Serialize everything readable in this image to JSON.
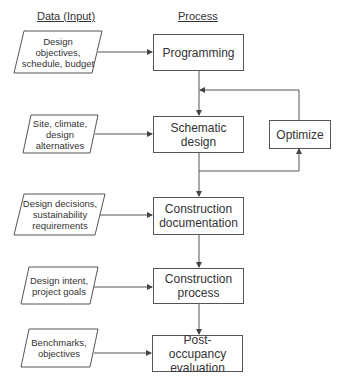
{
  "headers": {
    "input": "Data (Input)",
    "process": "Process"
  },
  "process_steps": [
    {
      "id": "programming",
      "label": "Programming"
    },
    {
      "id": "schematic",
      "label": "Schematic design"
    },
    {
      "id": "construction_doc",
      "label": "Construction documentation"
    },
    {
      "id": "construction_process",
      "label": "Construction process"
    },
    {
      "id": "poe",
      "label": "Post-occupancy evaluation"
    }
  ],
  "feedback": {
    "label": "Optimize"
  },
  "inputs": [
    {
      "label": "Design objectives, schedule, budget",
      "lines": [
        "Design",
        "objectives,",
        "schedule, budget"
      ]
    },
    {
      "label": "Site, climate, design alternatives",
      "lines": [
        "Site, climate,",
        "design",
        "alternatives"
      ]
    },
    {
      "label": "Design decisions, sustainability requirements",
      "lines": [
        "Design decisions,",
        "sustainability",
        "requirements"
      ]
    },
    {
      "label": "Design intent, project goals",
      "lines": [
        "Design intent,",
        "project goals"
      ]
    },
    {
      "label": "Benchmarks, objectives",
      "lines": [
        "Benchmarks,",
        "objectives"
      ]
    }
  ],
  "colors": {
    "stroke": "#555555",
    "text": "#333333",
    "background": "#ffffff"
  }
}
